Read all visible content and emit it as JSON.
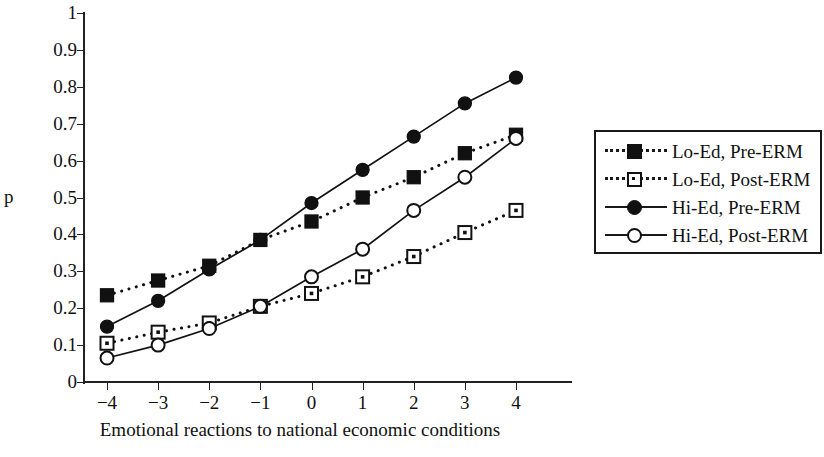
{
  "chart_data": {
    "type": "line",
    "title": "",
    "xlabel": "Emotional reactions to national economic conditions",
    "ylabel": "p",
    "x": [
      -4,
      -3,
      -2,
      -1,
      0,
      1,
      2,
      3,
      4
    ],
    "xticklabels": [
      "−4",
      "−3",
      "−2",
      "−1",
      "0",
      "1",
      "2",
      "3",
      "4"
    ],
    "yticklabels": [
      "0",
      "0.1",
      "0.2",
      "0.3",
      "0.4",
      "0.5",
      "0.6",
      "0.7",
      "0.8",
      "0.9",
      "1"
    ],
    "ytickvalues": [
      0,
      0.1,
      0.2,
      0.3,
      0.4,
      0.5,
      0.6,
      0.7,
      0.8,
      0.9,
      1
    ],
    "xlim": [
      -4.45,
      4.45
    ],
    "ylim": [
      0,
      1
    ],
    "grid": false,
    "legend_position": "right",
    "series": [
      {
        "name": "Lo-Ed, Pre-ERM",
        "marker": "square-filled",
        "linestyle": "dotted",
        "color": "#111111",
        "values": [
          0.235,
          0.275,
          0.315,
          0.385,
          0.435,
          0.5,
          0.555,
          0.62,
          0.67
        ]
      },
      {
        "name": "Lo-Ed, Post-ERM",
        "marker": "square-open",
        "linestyle": "dotted",
        "color": "#111111",
        "values": [
          0.105,
          0.135,
          0.16,
          0.205,
          0.24,
          0.285,
          0.34,
          0.405,
          0.465
        ]
      },
      {
        "name": "Hi-Ed, Pre-ERM",
        "marker": "circle-filled",
        "linestyle": "solid",
        "color": "#111111",
        "values": [
          0.15,
          0.22,
          0.305,
          0.385,
          0.485,
          0.575,
          0.665,
          0.755,
          0.825
        ]
      },
      {
        "name": "Hi-Ed, Post-ERM",
        "marker": "circle-open",
        "linestyle": "solid",
        "color": "#111111",
        "values": [
          0.065,
          0.1,
          0.145,
          0.205,
          0.285,
          0.36,
          0.465,
          0.555,
          0.66
        ]
      }
    ]
  },
  "legend": {
    "entries": [
      {
        "label": "Lo-Ed, Pre-ERM",
        "marker": "square-filled",
        "linestyle": "dotted"
      },
      {
        "label": "Lo-Ed, Post-ERM",
        "marker": "square-open",
        "linestyle": "dotted"
      },
      {
        "label": "Hi-Ed, Pre-ERM",
        "marker": "circle-filled",
        "linestyle": "solid"
      },
      {
        "label": "Hi-Ed, Post-ERM",
        "marker": "circle-open",
        "linestyle": "solid"
      }
    ]
  }
}
